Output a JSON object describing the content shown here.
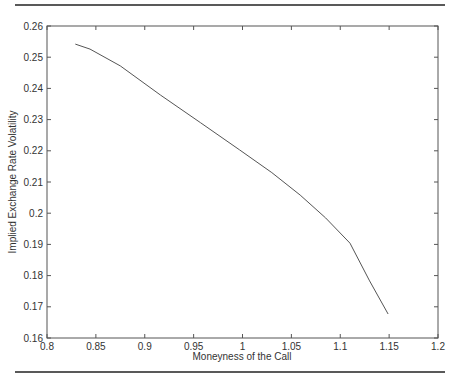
{
  "page": {
    "top_rule": true,
    "bottom_rule": true
  },
  "chart_data": {
    "type": "line",
    "title": "",
    "xlabel": "Moneyness of the Call",
    "ylabel": "Implied Exchange Rate Volatility",
    "xlim": [
      0.8,
      1.2
    ],
    "ylim": [
      0.16,
      0.26
    ],
    "xticks": [
      "0.8",
      "0.85",
      "0.9",
      "0.95",
      "1",
      "1.05",
      "1.1",
      "1.15",
      "1.2"
    ],
    "yticks": [
      "0.16",
      "0.17",
      "0.18",
      "0.19",
      "0.2",
      "0.21",
      "0.22",
      "0.23",
      "0.24",
      "0.25",
      "0.26"
    ],
    "grid": false,
    "legend": null,
    "series": [
      {
        "name": "implied volatility",
        "color": "#555555",
        "x": [
          0.829,
          0.844,
          0.875,
          0.916,
          0.957,
          0.997,
          1.03,
          1.059,
          1.085,
          1.11,
          1.13,
          1.149
        ],
        "y": [
          0.2542,
          0.2526,
          0.2472,
          0.2379,
          0.229,
          0.2203,
          0.213,
          0.2058,
          0.1985,
          0.1904,
          0.1783,
          0.1677
        ]
      }
    ]
  }
}
